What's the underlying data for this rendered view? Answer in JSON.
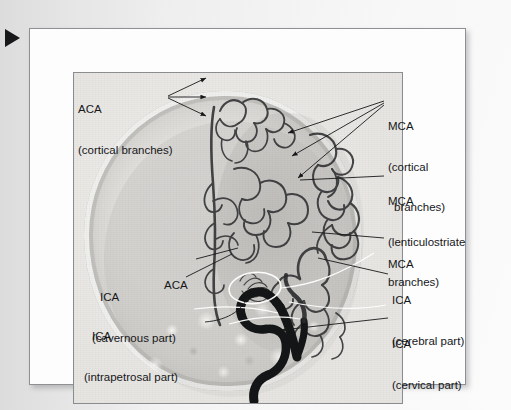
{
  "figure": {
    "modality": "cerebral angiogram",
    "view": "lateral carotid angiogram",
    "marker_icon": "play-triangle-marker"
  },
  "annotations": [
    {
      "id": "aca-cortical",
      "line1": "ACA",
      "line2": "(cortical branches)",
      "x": 78,
      "y": 76,
      "align": "left"
    },
    {
      "id": "mca-cortical",
      "line1": "MCA",
      "line2": "(cortical",
      "line3": "branches)",
      "x": 388,
      "y": 93,
      "align": "left"
    },
    {
      "id": "mca-lenticulo",
      "line1": "MCA",
      "line2": "(lenticulostriate",
      "line3": "branches)",
      "x": 388,
      "y": 168,
      "align": "left"
    },
    {
      "id": "mca",
      "line1": "MCA",
      "x": 388,
      "y": 231,
      "align": "left"
    },
    {
      "id": "ica-cerebral",
      "line1": "ICA",
      "line2": "(cerebral part)",
      "x": 392,
      "y": 267,
      "align": "left"
    },
    {
      "id": "ica-cervical",
      "line1": "ICA",
      "line2": "(cervical part)",
      "x": 392,
      "y": 311,
      "align": "left"
    },
    {
      "id": "aca-mid",
      "line1": "ACA",
      "x": 164,
      "y": 258,
      "align": "left"
    },
    {
      "id": "ica-cavernous",
      "line1": "ICA",
      "line2": "(cavernous part)",
      "x": 100,
      "y": 266,
      "align": "left"
    },
    {
      "id": "ica-intrapetrosal",
      "line1": "ICA",
      "line2": "(intrapetrosal part)",
      "x": 92,
      "y": 305,
      "align": "left"
    }
  ],
  "colors": {
    "text": "#16171a",
    "leader_line": "#1b1c1e",
    "highlight_ellipse": "#ffffff",
    "frame_border": "#8a8c90",
    "page_background": "#f7f7f7",
    "marker": "#17181a"
  }
}
